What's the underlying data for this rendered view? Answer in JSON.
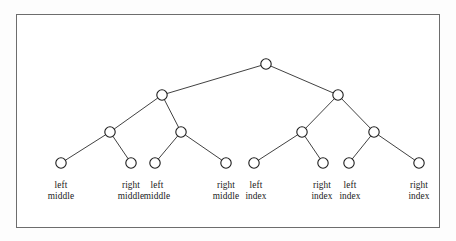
{
  "figure": {
    "type": "binary-tree-diagram",
    "title": "",
    "frame": {
      "x": 16,
      "y": 14,
      "width": 424,
      "height": 214,
      "border_color": "#6d6d6d",
      "background_color": "#ffffff"
    },
    "style": {
      "node_fill": "#ffffff",
      "node_stroke": "#1d1d1d",
      "edge_stroke": "#2b2b2b",
      "node_radius": 5.2,
      "text_color": "#1a1a1a"
    }
  },
  "tree": {
    "nodes": [
      {
        "id": "root",
        "x": 266,
        "y": 64,
        "level": 0,
        "label": ""
      },
      {
        "id": "n-l",
        "x": 162,
        "y": 95,
        "level": 1,
        "label": ""
      },
      {
        "id": "n-r",
        "x": 338,
        "y": 95,
        "level": 1,
        "label": ""
      },
      {
        "id": "n-ll",
        "x": 110,
        "y": 132,
        "level": 2,
        "label": ""
      },
      {
        "id": "n-lr",
        "x": 181,
        "y": 132,
        "level": 2,
        "label": ""
      },
      {
        "id": "n-rl",
        "x": 302,
        "y": 132,
        "level": 2,
        "label": ""
      },
      {
        "id": "n-rr",
        "x": 374,
        "y": 132,
        "level": 2,
        "label": ""
      },
      {
        "id": "leaf-1",
        "x": 61,
        "y": 163,
        "level": 3,
        "label": "left middle"
      },
      {
        "id": "leaf-2",
        "x": 131,
        "y": 163,
        "level": 3,
        "label": "right middle"
      },
      {
        "id": "leaf-3",
        "x": 155,
        "y": 163,
        "level": 3,
        "label": "left middle"
      },
      {
        "id": "leaf-4",
        "x": 226,
        "y": 163,
        "level": 3,
        "label": "right middle"
      },
      {
        "id": "leaf-5",
        "x": 254,
        "y": 163,
        "level": 3,
        "label": "left index"
      },
      {
        "id": "leaf-6",
        "x": 323,
        "y": 163,
        "level": 3,
        "label": "right index"
      },
      {
        "id": "leaf-7",
        "x": 349,
        "y": 163,
        "level": 3,
        "label": "left index"
      },
      {
        "id": "leaf-8",
        "x": 419,
        "y": 163,
        "level": 3,
        "label": "right index"
      }
    ],
    "edges": [
      {
        "from": "root",
        "to": "n-l"
      },
      {
        "from": "root",
        "to": "n-r"
      },
      {
        "from": "n-l",
        "to": "n-ll"
      },
      {
        "from": "n-l",
        "to": "n-lr"
      },
      {
        "from": "n-r",
        "to": "n-rl"
      },
      {
        "from": "n-r",
        "to": "n-rr"
      },
      {
        "from": "n-ll",
        "to": "leaf-1"
      },
      {
        "from": "n-ll",
        "to": "leaf-2"
      },
      {
        "from": "n-lr",
        "to": "leaf-3"
      },
      {
        "from": "n-lr",
        "to": "leaf-4"
      },
      {
        "from": "n-rl",
        "to": "leaf-5"
      },
      {
        "from": "n-rl",
        "to": "leaf-6"
      },
      {
        "from": "n-rr",
        "to": "leaf-7"
      },
      {
        "from": "n-rr",
        "to": "leaf-8"
      }
    ]
  },
  "labels": [
    {
      "id": "label-1",
      "x": 61,
      "y": 180,
      "line1": "left",
      "line2": "middle"
    },
    {
      "id": "label-2",
      "x": 131,
      "y": 180,
      "line1": "right",
      "line2": "middle"
    },
    {
      "id": "label-3",
      "x": 157,
      "y": 180,
      "line1": "left",
      "line2": "middle"
    },
    {
      "id": "label-4",
      "x": 226,
      "y": 180,
      "line1": "right",
      "line2": "middle"
    },
    {
      "id": "label-5",
      "x": 256,
      "y": 180,
      "line1": "left",
      "line2": "index"
    },
    {
      "id": "label-6",
      "x": 322,
      "y": 180,
      "line1": "right",
      "line2": "index"
    },
    {
      "id": "label-7",
      "x": 350,
      "y": 180,
      "line1": "left",
      "line2": "index"
    },
    {
      "id": "label-8",
      "x": 419,
      "y": 180,
      "line1": "right",
      "line2": "index"
    }
  ],
  "chart_data": {
    "type": "diagram",
    "subtype": "binary-tree",
    "title": "",
    "depth": 4,
    "node_count": 15,
    "leaf_count": 8,
    "leaf_labels": [
      "left middle",
      "right middle",
      "left middle",
      "right middle",
      "left index",
      "right index",
      "left index",
      "right index"
    ],
    "internal_node_labels": [
      "",
      "",
      "",
      "",
      "",
      "",
      ""
    ],
    "legend": [],
    "annotations": []
  }
}
